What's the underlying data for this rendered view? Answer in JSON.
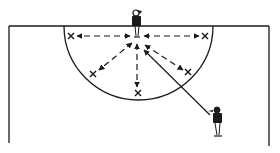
{
  "diagram": {
    "colors": {
      "ink": "#1a1a1a",
      "background": "#ffffff"
    },
    "elements": {
      "court": "court-lines",
      "circle": "shooting-semicircle",
      "players": [
        {
          "id": "centre-player",
          "role": "feeder at goal line"
        },
        {
          "id": "outside-player",
          "role": "passer outside circle"
        }
      ],
      "markers": [
        {
          "id": "x-top-left",
          "symbol": "×"
        },
        {
          "id": "x-top-right",
          "symbol": "×"
        },
        {
          "id": "x-mid-left",
          "symbol": "×"
        },
        {
          "id": "x-mid-right",
          "symbol": "×"
        },
        {
          "id": "x-bottom",
          "symbol": "×"
        }
      ],
      "passes": [
        {
          "from": "centre-player",
          "to": "x-top-left",
          "style": "dashed",
          "direction": "both"
        },
        {
          "from": "centre-player",
          "to": "x-top-right",
          "style": "dashed",
          "direction": "both"
        },
        {
          "from": "centre-player",
          "to": "x-mid-left",
          "style": "dashed",
          "direction": "both"
        },
        {
          "from": "centre-player",
          "to": "x-mid-right",
          "style": "dashed",
          "direction": "both"
        },
        {
          "from": "centre-player",
          "to": "x-bottom",
          "style": "dashed",
          "direction": "both"
        },
        {
          "from": "outside-player",
          "to": "centre-player",
          "style": "solid",
          "direction": "forward"
        }
      ]
    }
  }
}
